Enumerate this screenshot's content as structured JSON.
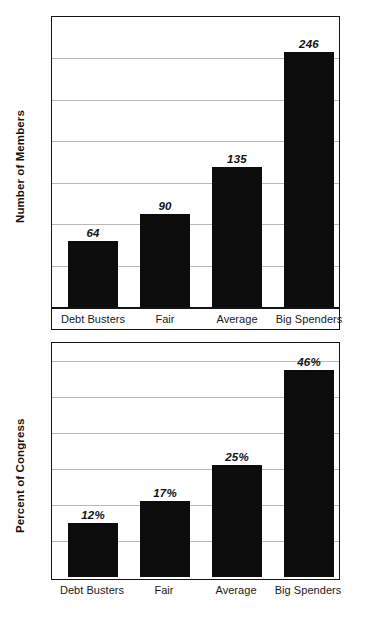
{
  "chart_data": [
    {
      "type": "bar",
      "id": "members",
      "title": "",
      "xlabel": "",
      "ylabel": "Number of Members",
      "categories": [
        "Debt Busters",
        "Fair",
        "Average",
        "Big Spenders"
      ],
      "values": [
        64,
        90,
        135,
        246
      ],
      "value_labels": [
        "64",
        "90",
        "135",
        "246"
      ],
      "ylim": [
        0,
        280
      ],
      "gridlines": [
        40,
        80,
        120,
        160,
        200,
        240
      ],
      "grid": true,
      "legend": "none",
      "bar_color": "#0c0c0c",
      "grid_color": "#b9b9b9",
      "frame_color": "#141414"
    },
    {
      "type": "bar",
      "id": "percent",
      "title": "",
      "xlabel": "",
      "ylabel": "Percent of Congress",
      "categories": [
        "Debt Busters",
        "Fair",
        "Average",
        "Big Spenders"
      ],
      "values": [
        12,
        17,
        25,
        46
      ],
      "value_labels": [
        "12%",
        "17%",
        "25%",
        "46%"
      ],
      "ylim": [
        0,
        52
      ],
      "gridlines": [
        8,
        16,
        24,
        32,
        40,
        48
      ],
      "grid": true,
      "legend": "none",
      "bar_color": "#0c0c0c",
      "grid_color": "#b9b9b9",
      "frame_color": "#141414"
    }
  ]
}
